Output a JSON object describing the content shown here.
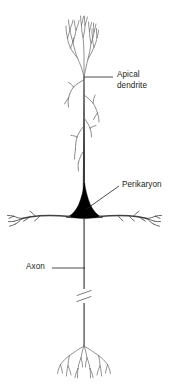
{
  "figure": {
    "background_color": "#ffffff",
    "ink_color": "#231f20",
    "soma_fill_color": "#000000",
    "line_color": "#58595b",
    "width": 172,
    "height": 392
  },
  "labels": {
    "apical_dendrite": "Apical\ndendrite",
    "apical_dendrite_line1": "Apical",
    "apical_dendrite_line2": "dendrite",
    "perikaryon": "Perikaryon",
    "axon": "Axon"
  },
  "leader_lines": [
    {
      "name": "apical-dendrite-leader",
      "style": "horizontal",
      "from": [
        84,
        77
      ],
      "to": [
        113,
        77
      ]
    },
    {
      "name": "perikaryon-leader",
      "style": "diagonal",
      "from": [
        86,
        209
      ],
      "to": [
        119,
        186
      ]
    },
    {
      "name": "axon-leader",
      "style": "horizontal",
      "from": [
        52,
        268
      ],
      "to": [
        86,
        268
      ]
    }
  ],
  "parts": [
    {
      "name": "apical-dendrite",
      "label": "Apical dendrite",
      "description": "Long ascending shaft with terminal tuft and oblique side branches"
    },
    {
      "name": "perikaryon",
      "label": "Perikaryon",
      "description": "Dark filled triangular cell body (soma)"
    },
    {
      "name": "basal-dendrites",
      "label": "",
      "description": "Horizontal branching dendrites at the base of the soma"
    },
    {
      "name": "axon",
      "label": "Axon",
      "description": "Descending fiber with break marks and terminal arbor"
    },
    {
      "name": "axon-terminal-arbor",
      "label": "",
      "description": "Branching terminal tree at bottom of axon"
    }
  ]
}
